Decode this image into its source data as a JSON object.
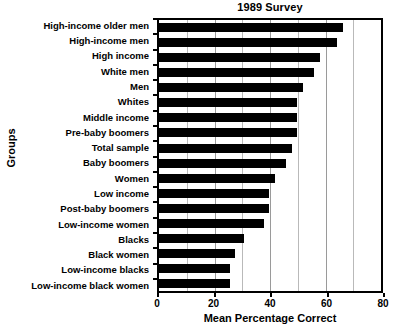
{
  "chart_data": {
    "type": "bar",
    "orientation": "horizontal",
    "title": "1989 Survey",
    "xlabel": "Mean Percentage Correct",
    "ylabel": "Groups",
    "xlim": [
      0,
      80
    ],
    "xticks": [
      0,
      20,
      40,
      60,
      80
    ],
    "xtick_labels": [
      "0",
      "20",
      "40",
      "60",
      "80"
    ],
    "grid": true,
    "gridlines_at": [
      10,
      20,
      30,
      40,
      50,
      60,
      70
    ],
    "legend": null,
    "bar_color": "#000000",
    "categories": [
      "High-income older men",
      "High-income men",
      "High income",
      "White men",
      "Men",
      "Whites",
      "Middle income",
      "Pre-baby boomers",
      "Total sample",
      "Baby boomers",
      "Women",
      "Low income",
      "Post-baby boomers",
      "Low-income women",
      "Blacks",
      "Black women",
      "Low-income blacks",
      "Low-income black women"
    ],
    "values": [
      65,
      63,
      57,
      55,
      51,
      49,
      49,
      49,
      47,
      45,
      41,
      39,
      39,
      37,
      30,
      27,
      25,
      25
    ]
  }
}
